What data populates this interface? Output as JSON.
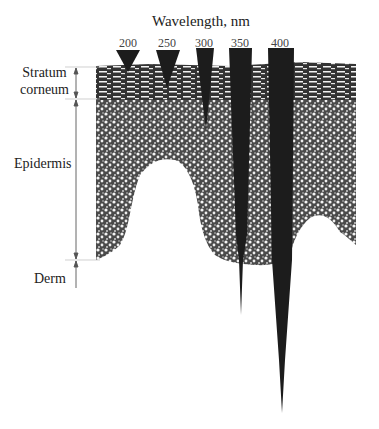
{
  "title": "Wavelength, nm",
  "wavelengths": [
    {
      "label": "200",
      "x": 128,
      "depth_end_y": 72
    },
    {
      "label": "250",
      "x": 167,
      "depth_end_y": 88
    },
    {
      "label": "300",
      "x": 204,
      "depth_end_y": 130
    },
    {
      "label": "350",
      "x": 240,
      "depth_end_y": 315
    },
    {
      "label": "400",
      "x": 280,
      "depth_end_y": 413
    }
  ],
  "layers": {
    "stratum_corneum": "Stratum\ncorneum",
    "stratum_line1": "Stratum",
    "stratum_line2": "corneum",
    "epidermis": "Epidermis",
    "derm": "Derm"
  },
  "colors": {
    "ink": "#222222",
    "tissue": "#3a3a3a",
    "background": "#ffffff"
  }
}
